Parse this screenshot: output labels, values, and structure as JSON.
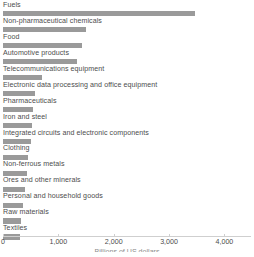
{
  "chart_data": {
    "type": "bar",
    "orientation": "horizontal",
    "title": "",
    "subtitle": "",
    "xlabel": "Billions of US dollars",
    "ylabel": "",
    "xlim": [
      0,
      4480
    ],
    "grid": false,
    "legend_position": "none",
    "bar_color": "#9a9a9a",
    "axis_color": "#cfcfcf",
    "text_color": "#4d4d4d",
    "categories": [
      "Fuels",
      "Non-pharmaceutical chemicals",
      "Food",
      "Automotive products",
      "Telecommunications equipment",
      "Electronic data processing and office equipment",
      "Pharmaceuticals",
      "Iron and steel",
      "Integrated circuits and electronic components",
      "Clothing",
      "Non-ferrous metals",
      "Ores and other minerals",
      "Personal and household goods",
      "Raw materials",
      "Textiles"
    ],
    "values": [
      3470,
      1500,
      1430,
      1340,
      705,
      580,
      545,
      520,
      500,
      450,
      430,
      400,
      360,
      330,
      300
    ],
    "xticks": [
      0,
      1000,
      2000,
      3000,
      4000
    ],
    "xtick_labels": [
      "0",
      "1,000",
      "2,000",
      "3,000",
      "4,000"
    ]
  }
}
